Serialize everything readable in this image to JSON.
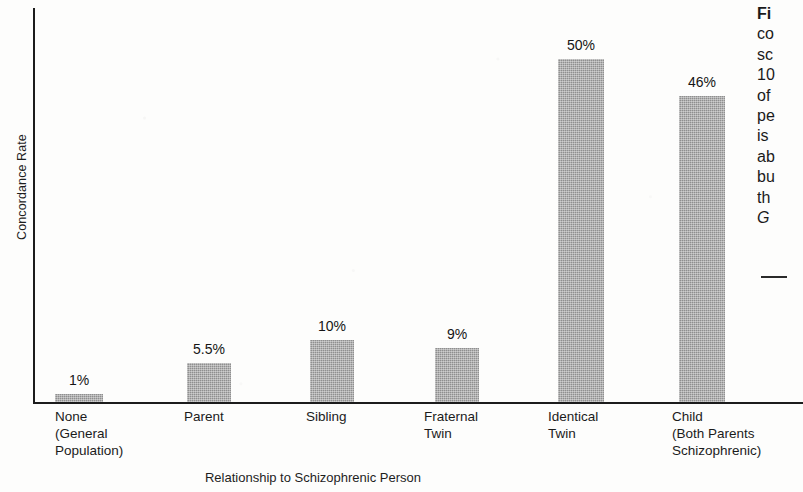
{
  "chart_data": {
    "type": "bar",
    "title": "",
    "xlabel": "Relationship to Schizophrenic Person",
    "ylabel": "Concordance Rate",
    "categories": [
      "None\n(General\nPopulation)",
      "Parent",
      "Sibling",
      "Fraternal\nTwin",
      "Identical\nTwin",
      "Child\n(Both Parents\nSchizophrenic)"
    ],
    "values": [
      1,
      5.5,
      10,
      9,
      50,
      46
    ],
    "value_labels": [
      "1%",
      "5.5%",
      "10%",
      "9%",
      "50%",
      "46%"
    ],
    "ylim": [
      0,
      55
    ],
    "grid": false,
    "legend": "none",
    "bar_color": "#8f8f8f",
    "axis_color": "#1c1c1c"
  },
  "axes": {
    "y_label": "Concordance Rate",
    "x_title": "Relationship to Schizophrenic Person"
  },
  "bars": [
    {
      "label": "None\n(General\nPopulation)",
      "value_label": "1%",
      "value": 1,
      "left": 55,
      "width": 48,
      "height": 8,
      "label_left": 55
    },
    {
      "label": "Parent",
      "value_label": "5.5%",
      "value": 5.5,
      "left": 187,
      "width": 44,
      "height": 39,
      "label_left": 184
    },
    {
      "label": "Sibling",
      "value_label": "10%",
      "value": 10,
      "left": 310,
      "width": 44,
      "height": 62,
      "label_left": 306
    },
    {
      "label": "Fraternal\nTwin",
      "value_label": "9%",
      "value": 9,
      "left": 435,
      "width": 44,
      "height": 54,
      "label_left": 424
    },
    {
      "label": "Identical\nTwin",
      "value_label": "50%",
      "value": 50,
      "left": 558,
      "width": 46,
      "height": 343,
      "label_left": 548
    },
    {
      "label": "Child\n(Both Parents\nSchizophrenic)",
      "value_label": "46%",
      "value": 46,
      "left": 679,
      "width": 46,
      "height": 306,
      "label_left": 672
    }
  ],
  "caption": {
    "lead": "Fi",
    "lines": [
      "co",
      "sc",
      "10",
      "of",
      "pe",
      "is",
      "ab",
      "bu",
      "th"
    ],
    "italic_line": "G",
    "rule": "—"
  }
}
